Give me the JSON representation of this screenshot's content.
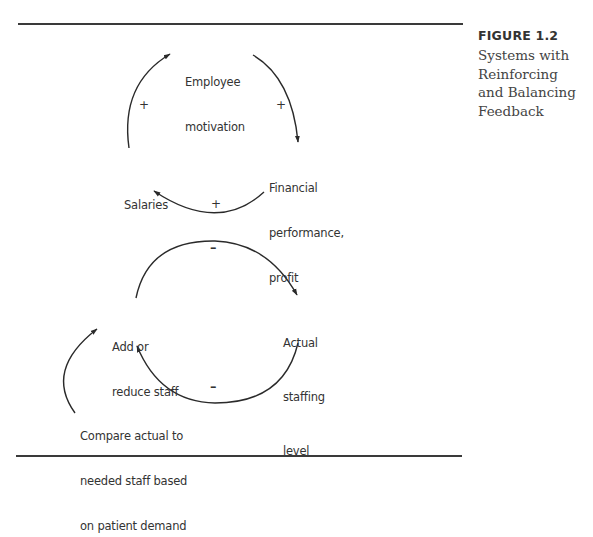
{
  "figure": {
    "label": "FIGURE 1.2",
    "title_lines": [
      "Systems with",
      "Reinforcing",
      "and Balancing",
      "Feedback"
    ]
  },
  "reinforcing_loop": {
    "nodes": {
      "employee_motivation": [
        "Employee",
        "motivation"
      ],
      "financial_performance": [
        "Financial",
        "performance,",
        "profit"
      ],
      "salaries": [
        "Salaries"
      ]
    },
    "links": [
      {
        "from": "Employee motivation",
        "to": "Financial performance, profit",
        "sign": "+"
      },
      {
        "from": "Financial performance, profit",
        "to": "Salaries",
        "sign": "+"
      },
      {
        "from": "Salaries",
        "to": "Employee motivation",
        "sign": "+"
      }
    ]
  },
  "balancing_loop": {
    "nodes": {
      "add_reduce_staff": [
        "Add or",
        "reduce staff"
      ],
      "actual_staffing": [
        "Actual",
        "staffing",
        "level"
      ],
      "compare": [
        "Compare actual to",
        "needed staff based",
        "on patient demand"
      ]
    },
    "links": [
      {
        "from": "Add or reduce staff",
        "to": "Actual staffing level",
        "sign": "–"
      },
      {
        "from": "Actual staffing level",
        "to": "Add or reduce staff",
        "sign": "–"
      },
      {
        "from": "Compare actual to needed staff based on patient demand",
        "to": "Add or reduce staff",
        "sign": ""
      }
    ]
  },
  "colors": {
    "ink": "#333333",
    "rule": "#3a3a3a",
    "background": "#ffffff"
  }
}
